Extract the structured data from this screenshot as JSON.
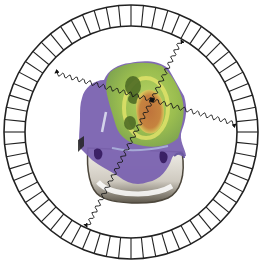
{
  "diagram": {
    "title": "PET scanner detector ring with annihilation photon pairs",
    "ring": {
      "center": [
        131,
        132
      ],
      "outer_radius": 127,
      "inner_radius": 106,
      "segments": 64,
      "stroke": "#222222"
    },
    "head_scan": {
      "label": "Axial head PET/CT fusion overlay",
      "colors": {
        "purple_tissue": "#7a62b0",
        "purple_dark": "#4a2f78",
        "green_uptake": "#9cc24a",
        "dark_green": "#4f6b25",
        "yellow_ring": "#e3e36a",
        "hot_spot": "#c0703a",
        "bone": "#d8d4cc",
        "bone_shadow": "#6b6558"
      }
    },
    "photon_pairs": [
      {
        "name": "pair-1",
        "from": [
          55,
          73
        ],
        "origin": [
          152,
          100
        ],
        "to": [
          236,
          124
        ]
      },
      {
        "name": "pair-2",
        "from": [
          181,
          40
        ],
        "origin": [
          152,
          100
        ],
        "to": [
          87,
          227
        ]
      }
    ],
    "annihilation_point": [
      152,
      100
    ]
  }
}
